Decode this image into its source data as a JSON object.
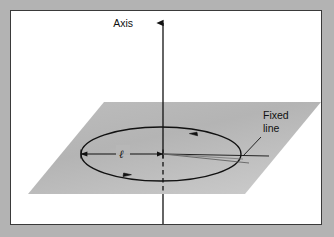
{
  "figure": {
    "type": "geometry-diagram",
    "background_color": "#b3b3b3",
    "panel_color": "#ffffff",
    "border_color": "#3a3a3a",
    "plane_color": "#b7b7b7",
    "line_color": "#111111",
    "labels": {
      "axis": "Axis",
      "fixed_line": "Fixed\nline",
      "fixed_line_1": "Fixed",
      "fixed_line_2": "line",
      "radius": "ℓ"
    },
    "geometry": {
      "axis_x": 152,
      "axis_top_y": 11,
      "axis_bottom_y": 213,
      "axis_dash_start_y": 143,
      "axis_dash_end_y": 183,
      "ellipse_cx": 150,
      "ellipse_cy": 143,
      "ellipse_rx": 80,
      "ellipse_ry": 27,
      "plane_points": "93,91 310,91 234,183 17,183",
      "radius_arrow_from_x": 70,
      "radius_arrow_to_x": 152,
      "radius_arrow_y": 143,
      "fixed_line_end_x": 258,
      "rotation_arrow_top": "180,122",
      "rotation_arrow_bottom": "118,163"
    }
  }
}
